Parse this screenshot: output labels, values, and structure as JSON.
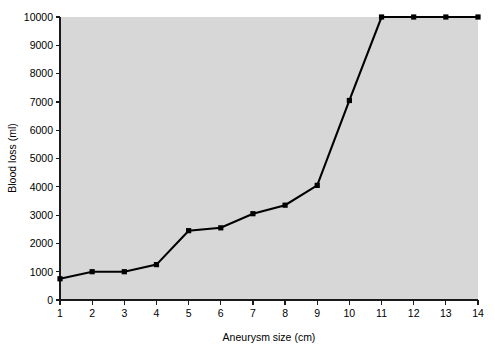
{
  "chart_data": {
    "type": "line",
    "title": "",
    "subtitle": "",
    "xlabel": "Aneurysm size (cm)",
    "ylabel": "Blood loss (ml)",
    "xlim": [
      1,
      14
    ],
    "ylim": [
      0,
      10000
    ],
    "grid": false,
    "legend_position": "none",
    "x_ticks": [
      1,
      2,
      3,
      4,
      5,
      6,
      7,
      8,
      9,
      10,
      11,
      12,
      13,
      14
    ],
    "x_tick_labels": [
      "1",
      "2",
      "3",
      "4",
      "5",
      "6",
      "7",
      "8",
      "9",
      "10",
      "11",
      "12",
      "13",
      "14"
    ],
    "y_ticks": [
      0,
      1000,
      2000,
      3000,
      4000,
      5000,
      6000,
      7000,
      8000,
      9000,
      10000
    ],
    "y_tick_labels": [
      "0",
      "1000",
      "2000",
      "3000",
      "4000",
      "5000",
      "6000",
      "7000",
      "8000",
      "9000",
      "10000"
    ],
    "x": [
      1,
      2,
      3,
      4,
      5,
      6,
      7,
      8,
      9,
      10,
      11,
      12,
      13,
      14
    ],
    "values": [
      750,
      1000,
      1000,
      1250,
      2450,
      2550,
      3050,
      3350,
      4050,
      7050,
      10000,
      10000,
      10000,
      10000
    ],
    "series": [
      {
        "name": "Blood loss",
        "marker": "square",
        "marker_color": "#000000",
        "line_color": "#000000",
        "values": [
          750,
          1000,
          1000,
          1250,
          2450,
          2550,
          3050,
          3350,
          4050,
          7050,
          10000,
          10000,
          10000,
          10000
        ]
      }
    ],
    "plot_background_color": "#d7d7d7",
    "figure_background_color": "#ffffff",
    "axis_color": "#1a1a1a"
  },
  "axes": {
    "y_axis_title": "Blood loss (ml)",
    "x_axis_title": "Aneurysm size (cm)"
  }
}
